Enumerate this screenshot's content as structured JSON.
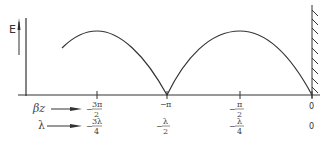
{
  "diagram": {
    "y_axis_label": "E",
    "wall": "conducting-plane",
    "row_labels": {
      "phase": "βz",
      "wavelength": "λ"
    },
    "ticks": [
      {
        "phase_sign": "−",
        "phase_num": "3π",
        "phase_den": "2",
        "lambda_sign": "−",
        "lambda_num": "3λ",
        "lambda_den": "4"
      },
      {
        "phase_sign": "−",
        "phase_num": "π",
        "phase_den": "",
        "lambda_sign": "−",
        "lambda_num": "λ",
        "lambda_den": "2"
      },
      {
        "phase_sign": "−",
        "phase_num": "π",
        "phase_den": "2",
        "lambda_sign": "−",
        "lambda_num": "λ",
        "lambda_den": "4"
      },
      {
        "phase_sign": "",
        "phase_num": "0",
        "phase_den": "",
        "lambda_sign": "",
        "lambda_num": "0",
        "lambda_den": ""
      }
    ],
    "curve": "|sin(βz)| standing-wave envelope, zeros at 0 and −π, maxima at −π/2 and −3π/2"
  }
}
